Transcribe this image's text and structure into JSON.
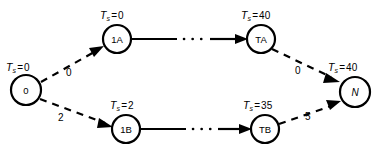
{
  "diagram": {
    "type": "directed-graph",
    "nodes": [
      {
        "id": "0",
        "label": "0",
        "italic": false,
        "cx": 26,
        "cy": 90,
        "r": 15,
        "ts_label": {
          "symbol": "T",
          "subscript": "s",
          "equals": "=",
          "value": "0"
        },
        "ts_x": 6,
        "ts_y": 62
      },
      {
        "id": "1A",
        "label": "1A",
        "italic": false,
        "cx": 117,
        "cy": 39,
        "r": 14,
        "ts_label": {
          "symbol": "T",
          "subscript": "s",
          "equals": "=",
          "value": "0"
        },
        "ts_x": 100,
        "ts_y": 10
      },
      {
        "id": "TA",
        "label": "TA",
        "italic": false,
        "cx": 261,
        "cy": 39,
        "r": 14,
        "ts_label": {
          "symbol": "T",
          "subscript": "s",
          "equals": "=",
          "value": "40"
        },
        "ts_x": 241,
        "ts_y": 10
      },
      {
        "id": "1B",
        "label": "1B",
        "italic": false,
        "cx": 126,
        "cy": 129,
        "r": 14,
        "ts_label": {
          "symbol": "T",
          "subscript": "s",
          "equals": "=",
          "value": "2"
        },
        "ts_x": 110,
        "ts_y": 100
      },
      {
        "id": "TB",
        "label": "TB",
        "italic": false,
        "cx": 265,
        "cy": 129,
        "r": 14,
        "ts_label": {
          "symbol": "T",
          "subscript": "s",
          "equals": "=",
          "value": "35"
        },
        "ts_x": 243,
        "ts_y": 100
      },
      {
        "id": "N",
        "label": "N",
        "italic": true,
        "cx": 355,
        "cy": 92,
        "r": 15,
        "ts_label": {
          "symbol": "T",
          "subscript": "s",
          "equals": "=",
          "value": "40"
        },
        "ts_x": 328,
        "ts_y": 62
      }
    ],
    "edges": [
      {
        "from": "0",
        "to": "1A",
        "style": "dashed",
        "weight": "0",
        "lx": 66,
        "ly": 68
      },
      {
        "from": "0",
        "to": "1B",
        "style": "dashed",
        "weight": "2",
        "lx": 58,
        "ly": 113
      },
      {
        "from": "1A",
        "to": "TA",
        "style": "solid-ellipsis",
        "weight": "",
        "lx": 0,
        "ly": 0
      },
      {
        "from": "1B",
        "to": "TB",
        "style": "solid-ellipsis",
        "weight": "",
        "lx": 0,
        "ly": 0
      },
      {
        "from": "TA",
        "to": "N",
        "style": "dashed",
        "weight": "0",
        "lx": 295,
        "ly": 66
      },
      {
        "from": "TB",
        "to": "N",
        "style": "dashed",
        "weight": "5",
        "lx": 305,
        "ly": 112
      }
    ]
  }
}
